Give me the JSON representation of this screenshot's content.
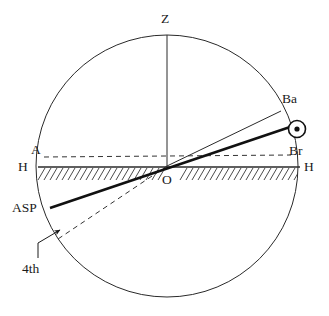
{
  "figure": {
    "type": "astronomical-horizon-diagram",
    "width": 329,
    "height": 316,
    "background_color": "#ffffff",
    "stroke_color": "#1a1a1a",
    "geometry": {
      "center": {
        "x": 167,
        "y": 166
      },
      "radius": 131,
      "circle_label": "celestial-meridian-circle"
    }
  },
  "labels": {
    "zenith": "Z",
    "origin": "O",
    "horizon_left": "H",
    "horizon_right": "H",
    "ascendant": "A",
    "birth": "Ba",
    "brightness": "Br",
    "asp": "ASP",
    "fourth": "4th"
  },
  "elements": {
    "circle": {
      "name": "celestial-sphere-circle",
      "stroke_width": 1
    },
    "zenith_line": {
      "name": "zenith-vertical-line",
      "from": {
        "x": 167,
        "y": 35
      },
      "to": {
        "x": 167,
        "y": 166
      },
      "stroke_width": 1
    },
    "horizon_line": {
      "name": "horizon-line",
      "from": {
        "x": 38,
        "y": 167
      },
      "to": {
        "x": 300,
        "y": 167
      },
      "stroke_width": 1.3
    },
    "hatching": {
      "name": "horizon-hatching",
      "count": 46,
      "slant": "up-right",
      "length": 13,
      "stroke_width": 0.9
    },
    "thin_ray_ba": {
      "name": "ba-ray-thin-line",
      "from": {
        "x": 167,
        "y": 166
      },
      "to": {
        "x": 281,
        "y": 111
      },
      "stroke_width": 1
    },
    "thick_line_asp": {
      "name": "asp-axis-thick-line",
      "from": {
        "x": 50,
        "y": 208
      },
      "to": {
        "x": 293,
        "y": 126
      },
      "stroke_width": 2.6
    },
    "dashed_line_a_br": {
      "name": "ascendant-descendant-dashed-line",
      "from": {
        "x": 44,
        "y": 157
      },
      "to": {
        "x": 291,
        "y": 155
      },
      "stroke_width": 1,
      "dash": "5 4"
    },
    "dashed_line_fourth": {
      "name": "fourth-house-dashed-line",
      "from": {
        "x": 167,
        "y": 166
      },
      "to": {
        "x": 60,
        "y": 238
      },
      "stroke_width": 1,
      "dash": "5 4"
    },
    "sun_symbol": {
      "name": "sun-circled-dot-symbol",
      "center": {
        "x": 297,
        "y": 129
      },
      "outer_radius": 8,
      "inner_radius": 2.6
    },
    "leader": {
      "name": "fourth-label-leader-arrow",
      "from": {
        "x": 38,
        "y": 258
      },
      "elbow": {
        "x": 38,
        "y": 243
      },
      "to": {
        "x": 62,
        "y": 229
      }
    }
  },
  "label_positions": {
    "zenith": {
      "x": 161,
      "y": 12
    },
    "origin": {
      "x": 162,
      "y": 174
    },
    "horizon_left": {
      "x": 19,
      "y": 160
    },
    "horizon_right": {
      "x": 305,
      "y": 160
    },
    "ascendant": {
      "x": 31,
      "y": 144
    },
    "birth": {
      "x": 283,
      "y": 93
    },
    "brightness": {
      "x": 290,
      "y": 145
    },
    "asp": {
      "x": 13,
      "y": 200
    },
    "fourth": {
      "x": 22,
      "y": 262
    }
  }
}
